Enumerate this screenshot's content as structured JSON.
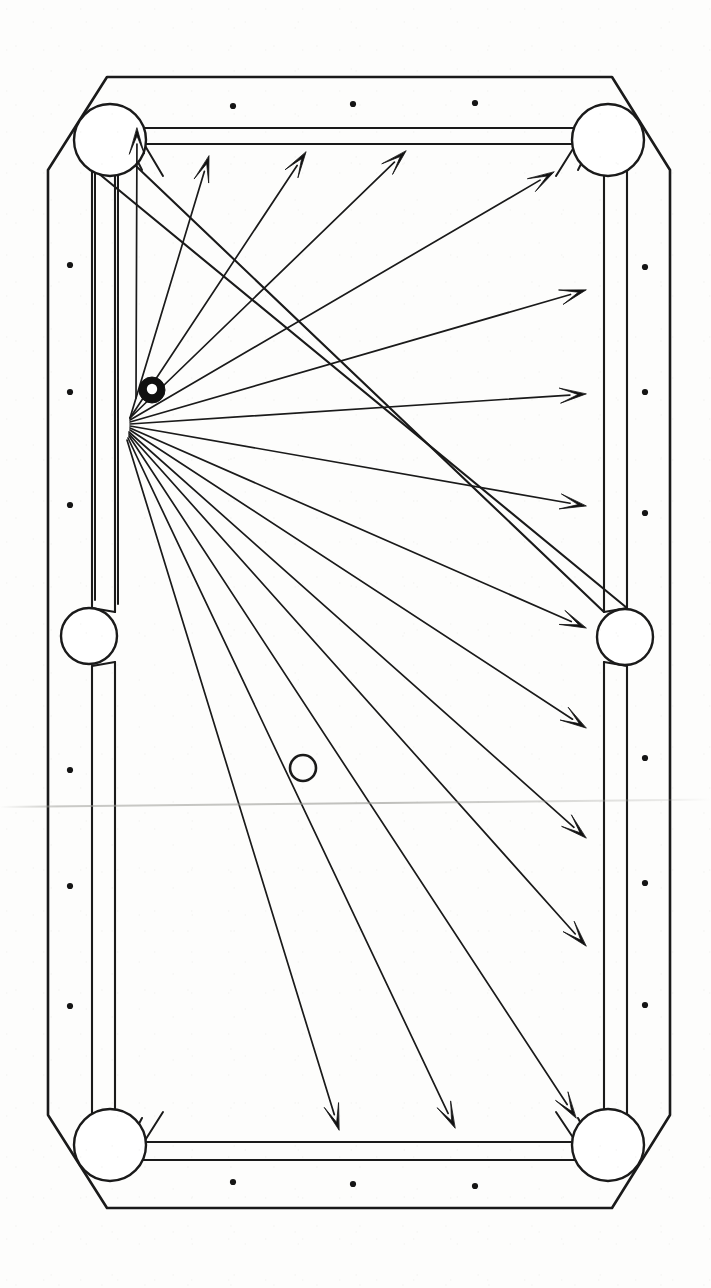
{
  "figure": {
    "canvas": {
      "width": 711,
      "height": 1288
    },
    "ink_color": "#1a1a1a",
    "paper_color": "#fdfdfc"
  },
  "table": {
    "outer_outline": "48,170 48,1115 107,1208 612,1208 670,1115 670,170 612,77 107,77",
    "cushion_outline": "92,163 92,1122 115,1160 604,1160 627,1122 627,163 604,125 115,125",
    "playfield_outline": "115,143 115,1140 137,1142 582,1142 604,1140 604,143 582,141 137,141",
    "rail_band_label": "outer rail and cushion nose double line",
    "stroke_width_outer": 2.6,
    "stroke_width_cushion": 2.2,
    "stroke_width_playfield": 2.2
  },
  "pockets": [
    {
      "name": "top-left-corner-pocket",
      "cx": 110,
      "cy": 140,
      "r": 36
    },
    {
      "name": "top-right-corner-pocket",
      "cx": 608,
      "cy": 140,
      "r": 36
    },
    {
      "name": "left-side-pocket",
      "cx": 89,
      "cy": 636,
      "r": 28
    },
    {
      "name": "right-side-pocket",
      "cx": 625,
      "cy": 637,
      "r": 28
    },
    {
      "name": "bottom-left-corner-pocket",
      "cx": 110,
      "cy": 1145,
      "r": 36
    },
    {
      "name": "bottom-right-corner-pocket",
      "cx": 608,
      "cy": 1145,
      "r": 36
    }
  ],
  "diamonds": {
    "label": "rail sight diamonds",
    "radius": 3.1,
    "points": [
      {
        "x": 233,
        "y": 106
      },
      {
        "x": 353,
        "y": 104
      },
      {
        "x": 475,
        "y": 103
      },
      {
        "x": 233,
        "y": 1182
      },
      {
        "x": 353,
        "y": 1184
      },
      {
        "x": 475,
        "y": 1186
      },
      {
        "x": 70,
        "y": 265
      },
      {
        "x": 70,
        "y": 392
      },
      {
        "x": 70,
        "y": 505
      },
      {
        "x": 70,
        "y": 770
      },
      {
        "x": 70,
        "y": 886
      },
      {
        "x": 70,
        "y": 1006
      },
      {
        "x": 645,
        "y": 267
      },
      {
        "x": 645,
        "y": 392
      },
      {
        "x": 645,
        "y": 513
      },
      {
        "x": 645,
        "y": 758
      },
      {
        "x": 645,
        "y": 883
      },
      {
        "x": 645,
        "y": 1005
      }
    ]
  },
  "balls": [
    {
      "name": "cue-ball",
      "style": "filled-black-with-white-center",
      "cx": 152,
      "cy": 390,
      "r": 13,
      "inner_r": 5.2,
      "fill": "#101010"
    },
    {
      "name": "object-ball",
      "style": "hollow-outline",
      "cx": 303,
      "cy": 768,
      "r": 13,
      "inner_r": 0,
      "fill": "none"
    }
  ],
  "aim_origin": {
    "x": 128,
    "y": 424,
    "label": "aim-line convergence point"
  },
  "aim_lines": {
    "count": 15,
    "stroke_width": 1.7,
    "arrowhead_length": 26,
    "arrowhead_half_width": 7.5,
    "arrowhead_notch": 8,
    "rays": [
      {
        "id": 1,
        "target_name": "top-left-corner-pocket",
        "x1": 136,
        "y1": 398,
        "x2": 137,
        "y2": 128
      },
      {
        "id": 2,
        "target_name": "top-rail-near-left",
        "x1": 130,
        "y1": 418,
        "x2": 209,
        "y2": 156
      },
      {
        "id": 3,
        "target_name": "top-rail-mid-left",
        "x1": 130,
        "y1": 418,
        "x2": 306,
        "y2": 152
      },
      {
        "id": 4,
        "target_name": "top-rail-mid-right",
        "x1": 130,
        "y1": 418,
        "x2": 406,
        "y2": 151
      },
      {
        "id": 5,
        "target_name": "top-right-corner-pocket",
        "x1": 130,
        "y1": 420,
        "x2": 554,
        "y2": 172
      },
      {
        "id": 6,
        "target_name": "right-rail-upper",
        "x1": 130,
        "y1": 422,
        "x2": 586,
        "y2": 290
      },
      {
        "id": 7,
        "target_name": "right-rail-level",
        "x1": 130,
        "y1": 424,
        "x2": 586,
        "y2": 394
      },
      {
        "id": 8,
        "target_name": "right-rail-lower-upper",
        "x1": 130,
        "y1": 426,
        "x2": 586,
        "y2": 506
      },
      {
        "id": 9,
        "target_name": "right-side-pocket",
        "x1": 130,
        "y1": 428,
        "x2": 586,
        "y2": 628
      },
      {
        "id": 10,
        "target_name": "right-rail-below-side",
        "x1": 130,
        "y1": 430,
        "x2": 586,
        "y2": 728
      },
      {
        "id": 11,
        "target_name": "right-rail-lower",
        "x1": 129,
        "y1": 432,
        "x2": 586,
        "y2": 838
      },
      {
        "id": 12,
        "target_name": "right-rail-low",
        "x1": 129,
        "y1": 434,
        "x2": 586,
        "y2": 946
      },
      {
        "id": 13,
        "target_name": "bottom-right-corner-pocket",
        "x1": 129,
        "y1": 436,
        "x2": 576,
        "y2": 1118
      },
      {
        "id": 14,
        "target_name": "bottom-rail-right",
        "x1": 128,
        "y1": 438,
        "x2": 455,
        "y2": 1128
      },
      {
        "id": 15,
        "target_name": "bottom-rail-mid",
        "x1": 127,
        "y1": 440,
        "x2": 339,
        "y2": 1130
      }
    ]
  },
  "artifacts": {
    "scan_crease": {
      "y": 806,
      "label": "horizontal scan fold line"
    }
  }
}
